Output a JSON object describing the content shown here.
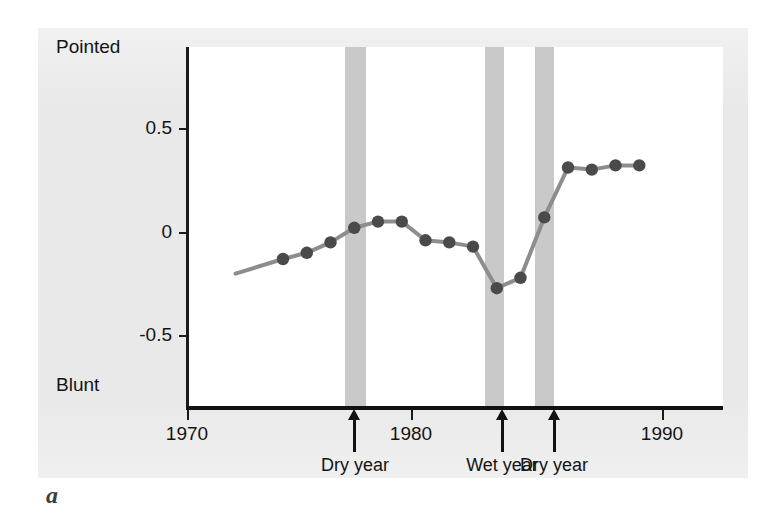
{
  "figure": {
    "part_letter": "a",
    "background_color": "#e9e9e9",
    "plot_background_color": "#ffffff"
  },
  "axes": {
    "y_top_label": "Pointed",
    "y_bottom_label": "Blunt",
    "y_ticks": [
      "0.5",
      "0",
      "-0.5"
    ],
    "x_ticks": [
      "1970",
      "1980",
      "1990"
    ]
  },
  "annotations": [
    {
      "label": "Dry year",
      "year": 1977
    },
    {
      "label": "Wet year",
      "year": 1983
    },
    {
      "label": "Dry year",
      "year": 1985
    }
  ],
  "colors": {
    "band": "#c9c9c9",
    "line": "#8d8d8d",
    "marker": "#4a4a4a",
    "axis": "#141414"
  },
  "chart_data": {
    "type": "line",
    "title": "",
    "xlabel": "",
    "ylabel": "Beak shape index",
    "ylim": [
      -0.85,
      0.78
    ],
    "xlim": [
      1970,
      1991.5
    ],
    "grid": false,
    "legend": "none",
    "y_axis_poles": {
      "high": "Pointed",
      "low": "Blunt"
    },
    "y_tick_values": [
      0.5,
      0,
      -0.5
    ],
    "x_tick_values": [
      1970,
      1980,
      1990
    ],
    "event_bands": [
      {
        "label": "Dry year",
        "year": 1977,
        "start": 1976.6,
        "end": 1977.5
      },
      {
        "label": "Wet year",
        "year": 1983,
        "start": 1982.5,
        "end": 1983.3
      },
      {
        "label": "Dry year",
        "year": 1985,
        "start": 1984.6,
        "end": 1985.4
      }
    ],
    "series": [
      {
        "name": "Beak shape index",
        "x": [
          1974,
          1975,
          1976,
          1977,
          1978,
          1979,
          1980,
          1981,
          1982,
          1983,
          1984,
          1985,
          1986,
          1987,
          1988,
          1989,
          1990
        ],
        "values": [
          -0.13,
          -0.1,
          -0.05,
          0.02,
          0.05,
          0.05,
          -0.04,
          -0.05,
          -0.07,
          -0.27,
          -0.22,
          0.07,
          0.31,
          0.3,
          0.32,
          0.32,
          null
        ]
      }
    ],
    "line_lead_in": {
      "x": 1972.0,
      "y": -0.2
    }
  }
}
